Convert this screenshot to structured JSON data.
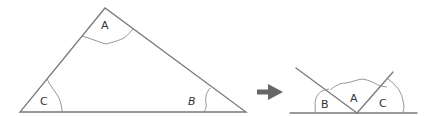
{
  "diagram": {
    "left_figure": {
      "shape": "triangle",
      "labels": {
        "top": "A",
        "left": "C",
        "right": "B"
      }
    },
    "arrow": {
      "icon": "right-arrow-icon",
      "color": "#666666"
    },
    "right_figure": {
      "shape": "angles-on-straight-line",
      "labels": {
        "left": "B",
        "middle": "A",
        "right": "C"
      }
    },
    "colors": {
      "stroke": "#7a7a7a",
      "arc": "#8a8a8a",
      "text": "#333333",
      "background": "#ffffff"
    }
  }
}
